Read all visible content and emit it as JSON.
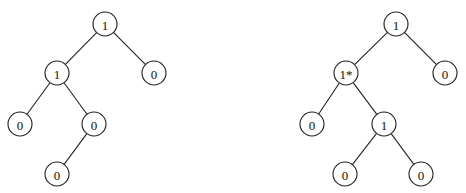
{
  "trees": [
    {
      "name": "left-tree",
      "nodes": [
        {
          "id": "a",
          "label": "1",
          "x": 105,
          "y": 24
        },
        {
          "id": "b",
          "label": "1",
          "x": 57,
          "y": 73
        },
        {
          "id": "c",
          "label": "0",
          "x": 154,
          "y": 73
        },
        {
          "id": "d",
          "label": "0",
          "x": 20,
          "y": 124
        },
        {
          "id": "e",
          "label": "0",
          "x": 94,
          "y": 124
        },
        {
          "id": "f",
          "label": "0",
          "x": 57,
          "y": 174
        }
      ],
      "edges": [
        [
          "a",
          "b"
        ],
        [
          "a",
          "c"
        ],
        [
          "b",
          "d"
        ],
        [
          "b",
          "e"
        ],
        [
          "e",
          "f"
        ]
      ]
    },
    {
      "name": "right-tree",
      "nodes": [
        {
          "id": "a",
          "label": "1",
          "x": 396,
          "y": 24
        },
        {
          "id": "b",
          "label": "1*",
          "x": 346,
          "y": 73
        },
        {
          "id": "c",
          "label": "0",
          "x": 445,
          "y": 73
        },
        {
          "id": "d",
          "label": "0",
          "x": 312,
          "y": 124
        },
        {
          "id": "e",
          "label": "1",
          "x": 384,
          "y": 124
        },
        {
          "id": "f",
          "label": "0",
          "x": 345,
          "y": 174
        },
        {
          "id": "g",
          "label": "0",
          "x": 421,
          "y": 174
        }
      ],
      "edges": [
        [
          "a",
          "b"
        ],
        [
          "a",
          "c"
        ],
        [
          "b",
          "d"
        ],
        [
          "b",
          "e"
        ],
        [
          "e",
          "f"
        ],
        [
          "e",
          "g"
        ]
      ]
    }
  ],
  "node_radius": 12
}
